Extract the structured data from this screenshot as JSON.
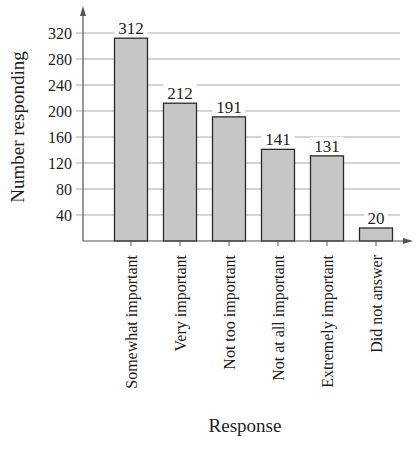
{
  "chart_data": {
    "type": "bar",
    "title": "",
    "xlabel": "Response",
    "ylabel": "Number responding",
    "categories": [
      "Somewhat important",
      "Very important",
      "Not too important",
      "Not at all important",
      "Extremely important",
      "Did not answer"
    ],
    "values": [
      312,
      212,
      191,
      141,
      131,
      20
    ],
    "data_labels": [
      "312",
      "212",
      "191",
      "141",
      "131",
      "20"
    ],
    "yticks": [
      40,
      80,
      120,
      160,
      200,
      240,
      280,
      320
    ],
    "ylim": [
      0,
      340
    ],
    "grid": true,
    "legend": null,
    "colors": {
      "bar_fill": "#c6c6c6",
      "bar_stroke": "#2a2a2a",
      "grid": "#a9a9a9",
      "axis": "#555555",
      "text": "#1e1e1e"
    }
  }
}
